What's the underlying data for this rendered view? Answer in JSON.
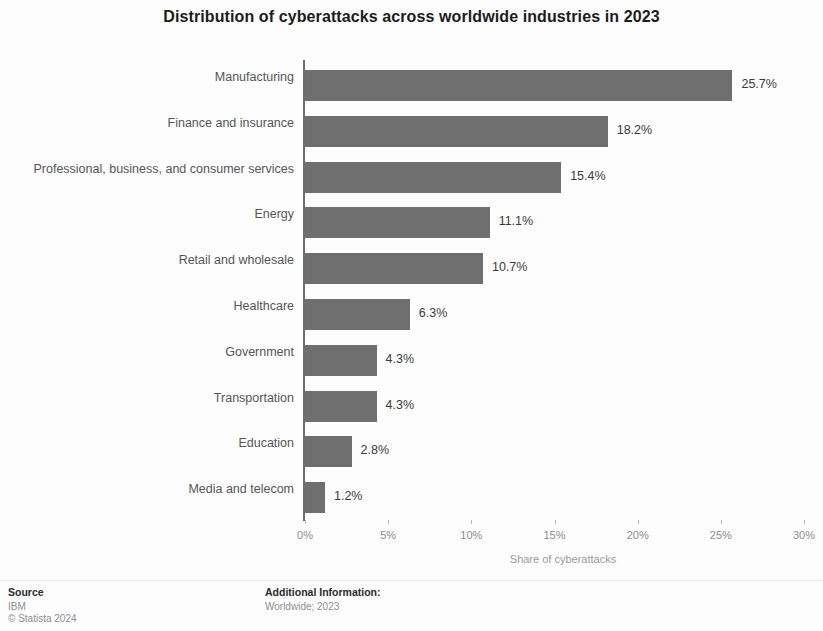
{
  "chart_data": {
    "type": "bar",
    "orientation": "horizontal",
    "title": "Distribution of cyberattacks across worldwide industries in 2023",
    "xlabel": "Share of cyberattacks",
    "ylabel": "",
    "xlim": [
      0,
      30
    ],
    "grid": false,
    "legend": null,
    "categories": [
      "Manufacturing",
      "Finance and insurance",
      "Professional, business, and consumer services",
      "Energy",
      "Retail and wholesale",
      "Healthcare",
      "Government",
      "Transportation",
      "Education",
      "Media and telecom"
    ],
    "values": [
      25.7,
      18.2,
      15.4,
      11.1,
      10.7,
      6.3,
      4.3,
      4.3,
      2.8,
      1.2
    ],
    "value_labels": [
      "25.7%",
      "18.2%",
      "15.4%",
      "11.1%",
      "10.7%",
      "6.3%",
      "4.3%",
      "4.3%",
      "2.8%",
      "1.2%"
    ],
    "xticks": [
      0,
      5,
      10,
      15,
      20,
      25,
      30
    ],
    "xtick_labels": [
      "0%",
      "5%",
      "10%",
      "15%",
      "20%",
      "25%",
      "30%"
    ],
    "bar_color": "#6f6f6f",
    "background_color": "#fdfdfd"
  },
  "footer": {
    "source_heading": "Source",
    "source_lines": [
      "IBM",
      "© Statista 2024"
    ],
    "info_heading": "Additional Information:",
    "info_lines": [
      "Worldwide; 2023"
    ]
  }
}
